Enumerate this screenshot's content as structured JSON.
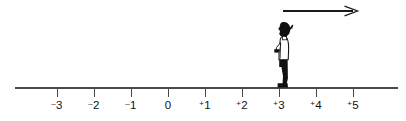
{
  "figure": {
    "type": "number-line-diagram",
    "background_color": "#ffffff",
    "ink_color": "#1a1a1a"
  },
  "number_line": {
    "axis_color": "#4a4a4a",
    "axis_y": 88,
    "axis_x_start": 15,
    "axis_x_end": 398,
    "tick_spacing_px": 37,
    "tick_length_px": 9,
    "origin_x": 168,
    "ticks": [
      {
        "value": -3,
        "sign": "–",
        "digit": "3",
        "x": 57
      },
      {
        "value": -2,
        "sign": "–",
        "digit": "2",
        "x": 94
      },
      {
        "value": -1,
        "sign": "–",
        "digit": "1",
        "x": 131
      },
      {
        "value": 0,
        "sign": "",
        "digit": "0",
        "x": 168
      },
      {
        "value": 1,
        "sign": "+",
        "digit": "1",
        "x": 205
      },
      {
        "value": 2,
        "sign": "+",
        "digit": "2",
        "x": 242
      },
      {
        "value": 3,
        "sign": "+",
        "digit": "3",
        "x": 279
      },
      {
        "value": 4,
        "sign": "+",
        "digit": "4",
        "x": 316
      },
      {
        "value": 5,
        "sign": "+",
        "digit": "5",
        "x": 353
      }
    ]
  },
  "motion_arrow": {
    "direction": "right",
    "x_start": 283,
    "x_end": 357,
    "y": 11,
    "color": "#1a1a1a",
    "stroke_width": 1.3
  },
  "walker": {
    "position_value": 3,
    "position_x": 283,
    "baseline_y": 88,
    "height_px": 62,
    "facing": "left",
    "hair_color": "#111111",
    "coat_color": "#ffffff",
    "coat_outline": "#111111",
    "legs_color": "#111111",
    "strap_color": "#111111"
  }
}
